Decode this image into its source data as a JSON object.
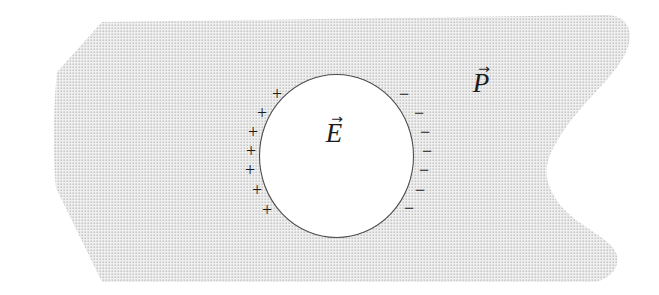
{
  "figure": {
    "kind": "dielectric-cavity-diagram"
  },
  "labels": {
    "cavity_field": {
      "letter": "E",
      "arrow": "→"
    },
    "polarization": {
      "letter": "P",
      "arrow": "→"
    }
  },
  "charges": {
    "positive": [
      "+",
      "+",
      "+",
      "+",
      "+",
      "+",
      "+"
    ],
    "negative": [
      "−",
      "−",
      "−",
      "−",
      "−",
      "−",
      "−"
    ]
  },
  "colors": {
    "background": "#ffffff",
    "dielectric_base": "#efefef",
    "dielectric_dot": "#c6c6c6",
    "cavity_fill": "#ffffff",
    "cavity_outline": "#4d4d4d",
    "text": "#1c1c1c"
  }
}
